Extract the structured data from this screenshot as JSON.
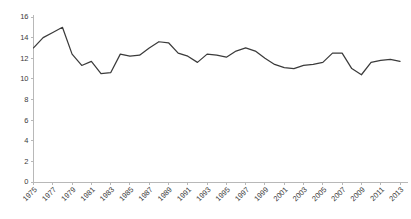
{
  "chart_data": {
    "type": "line",
    "title": "",
    "subtitle": "",
    "xlabel": "",
    "ylabel": "",
    "xlim": [
      1975,
      2013
    ],
    "ylim": [
      0,
      16
    ],
    "grid": false,
    "legend": false,
    "legend_position": "none",
    "line_color": "#3b3b3b",
    "axis_color": "#b8b8b8",
    "label_color": "#3a3a3a",
    "ytick_labels": [
      "16",
      "14",
      "12",
      "10",
      "8",
      "6",
      "4",
      "2",
      "0"
    ],
    "ytick_values": [
      16,
      14,
      12,
      10,
      8,
      6,
      4,
      2,
      0
    ],
    "xtick_labels": [
      "1975",
      "1977",
      "1979",
      "1981",
      "1983",
      "1985",
      "1987",
      "1989",
      "1991",
      "1993",
      "1995",
      "1997",
      "1999",
      "2001",
      "2003",
      "2005",
      "2007",
      "2009",
      "2011",
      "2013"
    ],
    "xtick_values": [
      1975,
      1977,
      1979,
      1981,
      1983,
      1985,
      1987,
      1989,
      1991,
      1993,
      1995,
      1997,
      1999,
      2001,
      2003,
      2005,
      2007,
      2009,
      2011,
      2013
    ],
    "x": [
      1975,
      1976,
      1977,
      1978,
      1979,
      1980,
      1981,
      1982,
      1983,
      1984,
      1985,
      1986,
      1987,
      1988,
      1989,
      1990,
      1991,
      1992,
      1993,
      1994,
      1995,
      1996,
      1997,
      1998,
      1999,
      2000,
      2001,
      2002,
      2003,
      2004,
      2005,
      2006,
      2007,
      2008,
      2009,
      2010,
      2011,
      2012,
      2013
    ],
    "values": [
      13.0,
      14.0,
      14.5,
      15.0,
      12.4,
      11.3,
      11.7,
      10.5,
      10.6,
      12.4,
      12.2,
      12.3,
      13.0,
      13.6,
      13.5,
      12.5,
      12.2,
      11.6,
      12.4,
      12.3,
      12.1,
      12.7,
      13.0,
      12.7,
      12.0,
      11.4,
      11.1,
      11.0,
      11.3,
      11.4,
      11.6,
      12.5,
      12.5,
      11.0,
      10.4,
      11.6,
      11.8,
      11.9,
      11.7
    ],
    "series": [
      {
        "name": "series-1",
        "values": [
          13.0,
          14.0,
          14.5,
          15.0,
          12.4,
          11.3,
          11.7,
          10.5,
          10.6,
          12.4,
          12.2,
          12.3,
          13.0,
          13.6,
          13.5,
          12.5,
          12.2,
          11.6,
          12.4,
          12.3,
          12.1,
          12.7,
          13.0,
          12.7,
          12.0,
          11.4,
          11.1,
          11.0,
          11.3,
          11.4,
          11.6,
          12.5,
          12.5,
          11.0,
          10.4,
          11.6,
          11.8,
          11.9,
          11.7
        ]
      }
    ]
  }
}
